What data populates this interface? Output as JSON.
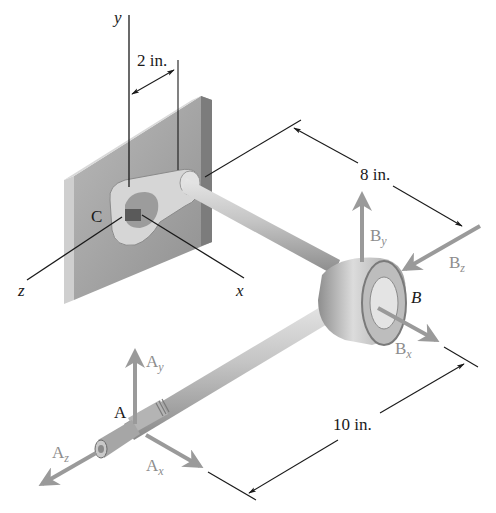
{
  "figure": {
    "type": "engineering-statics-diagram"
  },
  "axes": {
    "x_label": "x",
    "y_label": "y",
    "z_label": "z"
  },
  "points": {
    "A": "A",
    "B": "B",
    "C": "C"
  },
  "dimensions": {
    "offset": "2 in.",
    "length_cb": "8 in.",
    "length_ab": "10 in."
  },
  "forces": {
    "Ay": {
      "base": "A",
      "sub": "y"
    },
    "Ax": {
      "base": "A",
      "sub": "x"
    },
    "Az": {
      "base": "A",
      "sub": "z"
    },
    "By": {
      "base": "B",
      "sub": "y"
    },
    "Bx": {
      "base": "B",
      "sub": "x"
    },
    "Bz": {
      "base": "B",
      "sub": "z"
    }
  },
  "colors": {
    "force_arrow": "#9a9a9a",
    "line": "#1a1a1a",
    "plate_front": "#a8a8a8",
    "plate_side": "#c8c8c8",
    "rod": "#bdbdbd"
  }
}
